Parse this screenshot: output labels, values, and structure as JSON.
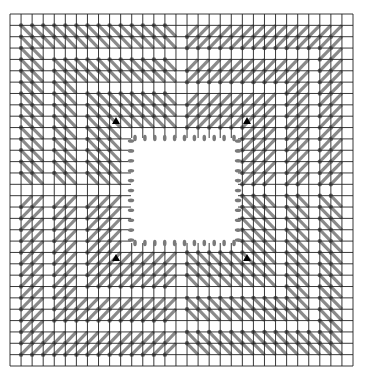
{
  "diagram": {
    "type": "package-routing-layout",
    "canvas": {
      "width": 367,
      "height": 381
    },
    "grid": {
      "x0": 10,
      "y0": 14,
      "x1": 353,
      "y1": 366,
      "cols": 31,
      "rows": 31,
      "line_color": "#222222"
    },
    "routing": {
      "trace_color": "#8a8a8a",
      "via_color": "#6e6e6e",
      "empty_ring_depths": [
        0,
        3,
        6
      ],
      "inner_plain_depth": 10,
      "center_index": 15,
      "quadrant_direction": {
        "top_left": "backslash",
        "top_right": "slash",
        "bottom_left": "slash",
        "bottom_right": "backslash"
      }
    },
    "die": {
      "x": 131,
      "y": 138,
      "width": 107,
      "height": 105,
      "fill": "#ffffff",
      "pads_per_side": 11,
      "pad_color": "#7a7a7a"
    },
    "markers": [
      {
        "name": "corner-marker-top-left",
        "x": 116,
        "y": 121
      },
      {
        "name": "corner-marker-top-right",
        "x": 247,
        "y": 121
      },
      {
        "name": "corner-marker-bottom-left",
        "x": 116,
        "y": 258
      },
      {
        "name": "corner-marker-bottom-right",
        "x": 247,
        "y": 258
      }
    ],
    "marker_color": "#000000"
  }
}
